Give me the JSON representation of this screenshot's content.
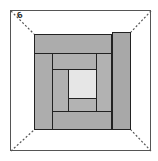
{
  "diagram": {
    "type": "log-cabin-quilt-block",
    "label": "6",
    "colors": {
      "frame": "#555555",
      "outline": "#222222",
      "dark_fabric": "#a9a9a9",
      "medium_fabric": "#b3b3b3",
      "center": "#e6e6e6",
      "background": "#ffffff"
    },
    "pieces": [
      {
        "name": "right-strip",
        "x": 112,
        "y": 32,
        "w": 19,
        "h": 98,
        "fill": "#a8a8a8"
      },
      {
        "name": "top-strip",
        "x": 34,
        "y": 34,
        "w": 78,
        "h": 20,
        "fill": "#acacac"
      },
      {
        "name": "left-strip",
        "x": 34,
        "y": 53,
        "w": 19,
        "h": 77,
        "fill": "#adadad"
      },
      {
        "name": "bottom-strip",
        "x": 52,
        "y": 111,
        "w": 60,
        "h": 19,
        "fill": "#acacac"
      },
      {
        "name": "inner-right-strip",
        "x": 96,
        "y": 53,
        "w": 16,
        "h": 59,
        "fill": "#b2b2b2"
      },
      {
        "name": "inner-top-strip",
        "x": 52,
        "y": 53,
        "w": 45,
        "h": 17,
        "fill": "#b0b0b0"
      },
      {
        "name": "inner-left-strip",
        "x": 52,
        "y": 69,
        "w": 17,
        "h": 43,
        "fill": "#b1b1b1"
      },
      {
        "name": "inner-bottom-strip",
        "x": 68,
        "y": 98,
        "w": 29,
        "h": 14,
        "fill": "#b3b3b3"
      },
      {
        "name": "center-square",
        "x": 68,
        "y": 69,
        "w": 29,
        "h": 30,
        "fill": "#e6e6e6"
      }
    ]
  }
}
